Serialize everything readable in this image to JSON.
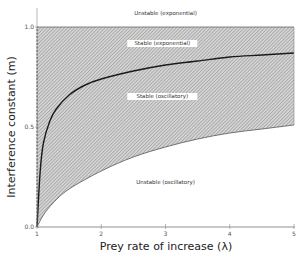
{
  "chart_data": {
    "type": "area",
    "title": "",
    "xlabel": "Prey rate of increase (λ)",
    "ylabel": "Interference constant (m)",
    "xlim": [
      1,
      5
    ],
    "ylim": [
      0,
      1.0
    ],
    "x_ticks": [
      "1",
      "2",
      "3",
      "4",
      "5"
    ],
    "y_ticks": [
      "0.0",
      "0.5",
      "1.0"
    ],
    "grid": false,
    "legend": null,
    "series": [
      {
        "name": "Stable boundary (upper, exponential/oscillatory divide)",
        "x": [
          1.0,
          1.05,
          1.1,
          1.2,
          1.3,
          1.5,
          1.75,
          2.0,
          2.5,
          3.0,
          3.5,
          4.0,
          4.5,
          5.0
        ],
        "values": [
          0.0,
          0.28,
          0.42,
          0.53,
          0.59,
          0.66,
          0.71,
          0.74,
          0.78,
          0.81,
          0.83,
          0.85,
          0.86,
          0.87
        ]
      },
      {
        "name": "Stability lower bound",
        "x": [
          1.0,
          1.1,
          1.25,
          1.5,
          2.0,
          2.5,
          3.0,
          3.5,
          4.0,
          4.5,
          5.0
        ],
        "values": [
          0.0,
          0.06,
          0.12,
          0.19,
          0.28,
          0.35,
          0.4,
          0.44,
          0.47,
          0.49,
          0.51
        ]
      }
    ],
    "shaded_region": {
      "description": "hatched region between lower bound curve and m = 1.0 (stable regimes)",
      "from_series": "Stability lower bound",
      "to_value": 1.0
    },
    "annotations": [
      {
        "text": "Unstable (exponential)",
        "x": 3.0,
        "y": 1.06
      },
      {
        "text": "Stable (exponential)",
        "x": 2.95,
        "y": 0.91
      },
      {
        "text": "Stable (oscillatory)",
        "x": 2.95,
        "y": 0.645
      },
      {
        "text": "Unstable (oscillatory)",
        "x": 3.0,
        "y": 0.215
      }
    ]
  }
}
